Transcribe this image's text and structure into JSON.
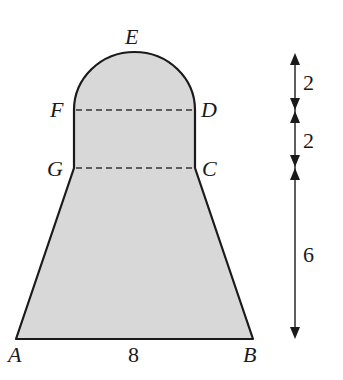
{
  "figure": {
    "fill_color": "#d8d8d8",
    "stroke_color": "#1a1a1a",
    "points": {
      "A": "A",
      "B": "B",
      "C": "C",
      "D": "D",
      "E": "E",
      "F": "F",
      "G": "G"
    },
    "dimensions": {
      "base_AB": "8",
      "semicircle_height": "2",
      "rectangle_height": "2",
      "trapezoid_height": "6"
    }
  }
}
